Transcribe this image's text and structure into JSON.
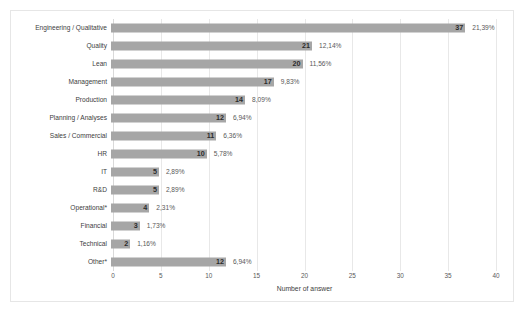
{
  "chart_data": {
    "type": "bar",
    "orientation": "horizontal",
    "title": "",
    "xlabel": "Number of answer",
    "ylabel": "",
    "xlim": [
      0,
      40
    ],
    "xticks": [
      "0",
      "5",
      "10",
      "15",
      "20",
      "25",
      "30",
      "35",
      "40"
    ],
    "grid": true,
    "legend": "none",
    "bar_color": "#a6a6a6",
    "categories": [
      "Engineering / Qualitative",
      "Quality",
      "Lean",
      "Management",
      "Production",
      "Planning / Analyses",
      "Sales / Commercial",
      "HR",
      "IT",
      "R&D",
      "Operational*",
      "Financial",
      "Technical",
      "Other*"
    ],
    "values": [
      37,
      21,
      20,
      17,
      14,
      12,
      11,
      10,
      5,
      5,
      4,
      3,
      2,
      12
    ],
    "value_labels": [
      "37",
      "21",
      "20",
      "17",
      "14",
      "12",
      "11",
      "10",
      "5",
      "5",
      "4",
      "3",
      "2",
      "12"
    ],
    "percent_labels": [
      "21,39%",
      "12,14%",
      "11,56%",
      "9,83%",
      "8,09%",
      "6,94%",
      "6,36%",
      "5,78%",
      "2,89%",
      "2,89%",
      "2,31%",
      "1,73%",
      "1,16%",
      "6,94%"
    ]
  }
}
